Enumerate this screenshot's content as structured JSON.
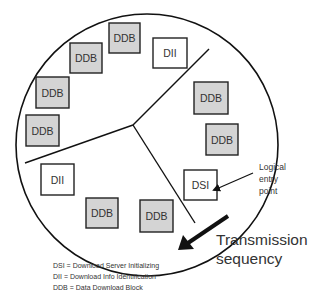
{
  "diagram": {
    "type": "carousel-cycle",
    "boxes": [
      {
        "id": "b1",
        "label": "DDB",
        "kind": "ddb",
        "x": 109,
        "y": 23,
        "w": 31,
        "h": 30
      },
      {
        "id": "b2",
        "label": "DII",
        "kind": "dii",
        "x": 153,
        "y": 38,
        "w": 34,
        "h": 30
      },
      {
        "id": "b3",
        "label": "DDB",
        "kind": "ddb",
        "x": 70,
        "y": 43,
        "w": 32,
        "h": 30
      },
      {
        "id": "b4",
        "label": "DDB",
        "kind": "ddb",
        "x": 36,
        "y": 77,
        "w": 33,
        "h": 31
      },
      {
        "id": "b5",
        "label": "DDB",
        "kind": "ddb",
        "x": 26,
        "y": 115,
        "w": 33,
        "h": 31
      },
      {
        "id": "b6",
        "label": "DDB",
        "kind": "ddb",
        "x": 194,
        "y": 82,
        "w": 34,
        "h": 32
      },
      {
        "id": "b7",
        "label": "DDB",
        "kind": "ddb",
        "x": 206,
        "y": 124,
        "w": 32,
        "h": 31
      },
      {
        "id": "b8",
        "label": "DSI",
        "kind": "dsi",
        "x": 184,
        "y": 170,
        "w": 33,
        "h": 30
      },
      {
        "id": "b9",
        "label": "DII",
        "kind": "dii",
        "x": 41,
        "y": 164,
        "w": 33,
        "h": 31
      },
      {
        "id": "b10",
        "label": "DDB",
        "kind": "ddb",
        "x": 86,
        "y": 198,
        "w": 32,
        "h": 30
      },
      {
        "id": "b11",
        "label": "DDB",
        "kind": "ddb",
        "x": 140,
        "y": 200,
        "w": 33,
        "h": 32
      }
    ],
    "entry_label": [
      "Logical",
      "entry",
      "point"
    ],
    "transmission_label": [
      "Transmission",
      "sequency"
    ],
    "legend": [
      "DSI = Download Server Initializing",
      "DII = Download Info Identification",
      "DDB = Data Download Block"
    ],
    "colors": {
      "ddb_fill": "#d4d4d4",
      "box_stroke": "#222222",
      "line": "#111111",
      "text": "#333333"
    }
  }
}
